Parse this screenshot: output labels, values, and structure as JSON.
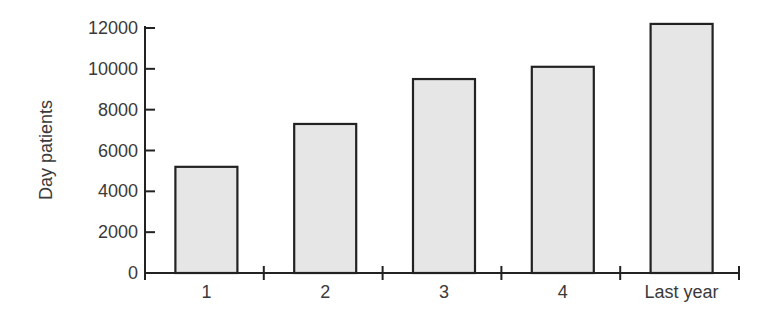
{
  "chart_data": {
    "type": "bar",
    "title": "",
    "xlabel": "",
    "ylabel": "Day patients",
    "categories": [
      "1",
      "2",
      "3",
      "4",
      "Last year"
    ],
    "values": [
      5200,
      7300,
      9500,
      10100,
      12200
    ],
    "ylim": [
      0,
      12000
    ],
    "yticks": [
      0,
      2000,
      4000,
      6000,
      8000,
      10000,
      12000
    ],
    "ytick_labels": [
      "0",
      "2000",
      "4000",
      "6000",
      "8000",
      "10000",
      "12000"
    ],
    "grid": false,
    "legend": null,
    "bar_fill": "#e6e6e6",
    "bar_edge": "#222222"
  }
}
